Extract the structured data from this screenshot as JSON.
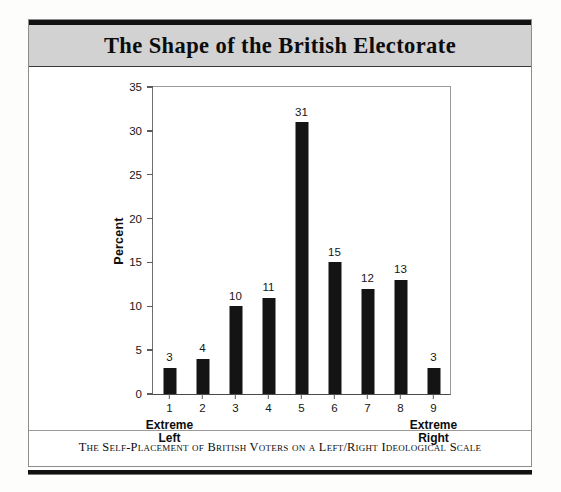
{
  "figure": {
    "title": "The Shape of the British Electorate",
    "caption": "The Self-Placement of British Voters on a Left/Right Ideological Scale",
    "left_anchor_line1": "Extreme",
    "left_anchor_line2": "Left",
    "right_anchor_line1": "Extreme",
    "right_anchor_line2": "Right",
    "colors": {
      "bar": "#141414",
      "banner": "#d2d2d2",
      "rule": "#111111",
      "page": "#ffffff"
    }
  },
  "chart_data": {
    "type": "bar",
    "title": "The Shape of the British Electorate",
    "subtitle": "The Self-Placement of British Voters on a Left/Right Ideological Scale",
    "xlabel": "",
    "ylabel": "Percent",
    "categories": [
      "1",
      "2",
      "3",
      "4",
      "5",
      "6",
      "7",
      "8",
      "9"
    ],
    "values": [
      3,
      4,
      10,
      11,
      31,
      15,
      12,
      13,
      3
    ],
    "data_labels": [
      "3",
      "4",
      "10",
      "11",
      "31",
      "15",
      "12",
      "13",
      "3"
    ],
    "ylim": [
      0,
      35
    ],
    "yticks": [
      0,
      5,
      10,
      15,
      20,
      25,
      30,
      35
    ],
    "ytick_labels": [
      "0",
      "5",
      "10",
      "15",
      "20",
      "25",
      "30",
      "35"
    ],
    "grid": false,
    "legend": null,
    "annotations": [
      {
        "text": "Extreme Left",
        "at_category": "1"
      },
      {
        "text": "Extreme Right",
        "at_category": "9"
      }
    ]
  }
}
